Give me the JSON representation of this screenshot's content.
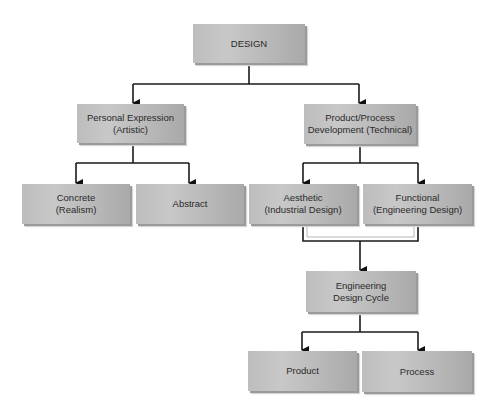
{
  "diagram": {
    "nodes": [
      {
        "id": "design",
        "label": "DESIGN"
      },
      {
        "id": "personal",
        "label": "Personal Expression\n(Artistic)"
      },
      {
        "id": "product_process",
        "label": "Product/Process\nDevelopment (Technical)"
      },
      {
        "id": "concrete",
        "label": "Concrete\n(Realism)"
      },
      {
        "id": "abstract",
        "label": "Abstract"
      },
      {
        "id": "aesthetic",
        "label": "Aesthetic\n(Industrial Design)"
      },
      {
        "id": "functional",
        "label": "Functional\n(Engineering Design)"
      },
      {
        "id": "eng_cycle",
        "label": "Engineering\nDesign Cycle"
      },
      {
        "id": "product",
        "label": "Product"
      },
      {
        "id": "process",
        "label": "Process"
      }
    ],
    "edges": [
      {
        "from": "design",
        "to": "personal"
      },
      {
        "from": "design",
        "to": "product_process"
      },
      {
        "from": "personal",
        "to": "concrete"
      },
      {
        "from": "personal",
        "to": "abstract"
      },
      {
        "from": "product_process",
        "to": "aesthetic"
      },
      {
        "from": "product_process",
        "to": "functional"
      },
      {
        "from": "aesthetic",
        "to": "eng_cycle"
      },
      {
        "from": "functional",
        "to": "eng_cycle"
      },
      {
        "from": "eng_cycle",
        "to": "product"
      },
      {
        "from": "eng_cycle",
        "to": "process"
      }
    ],
    "colors": {
      "box_fill": "#bdbdbd",
      "line": "#1a1a1a",
      "text": "#2a2a2a"
    }
  }
}
